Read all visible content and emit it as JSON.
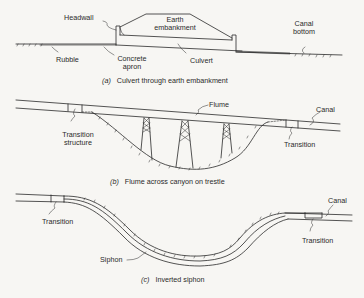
{
  "figure": {
    "panels": [
      {
        "id": "a",
        "caption_tag": "(a)",
        "caption": "Culvert through earth embankment",
        "labels": {
          "headwall": "Headwall",
          "earth_line1": "Earth",
          "earth_line2": "embankment",
          "canal_line1": "Canal",
          "canal_line2": "bottom",
          "rubble": "Rubble",
          "concrete_line1": "Concrete",
          "concrete_line2": "apron",
          "culvert": "Culvert"
        }
      },
      {
        "id": "b",
        "caption_tag": "(b)",
        "caption": "Flume across canyon on trestle",
        "labels": {
          "flume": "Flume",
          "canal": "Canal",
          "transition_structure_line1": "Transition",
          "transition_structure_line2": "structure",
          "transition": "Transition"
        }
      },
      {
        "id": "c",
        "caption_tag": "(c)",
        "caption": "Inverted siphon",
        "labels": {
          "canal": "Canal",
          "transition_left": "Transition",
          "transition_right": "Transition",
          "siphon": "Siphon"
        }
      }
    ]
  },
  "colors": {
    "background": "#f7f6f3",
    "ink": "#2a2a2a"
  }
}
